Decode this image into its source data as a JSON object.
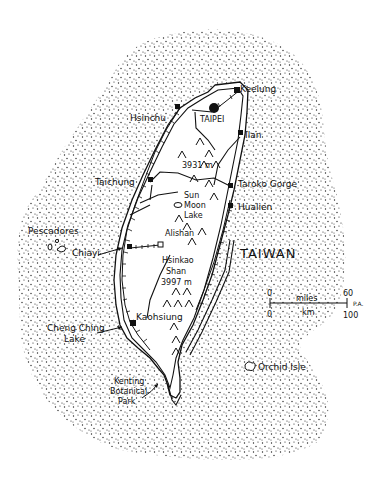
{
  "map": {
    "title": "TAIWAN",
    "cities": [
      {
        "name": "Keelung",
        "x": 240,
        "y": 92
      },
      {
        "name": "TAIPEI",
        "x": 205,
        "y": 117
      },
      {
        "name": "Hsinchu",
        "x": 130,
        "y": 118
      },
      {
        "name": "Ilan",
        "x": 242,
        "y": 135
      },
      {
        "name": "Taichung",
        "x": 95,
        "y": 185
      },
      {
        "name": "Taroko Gorge",
        "x": 238,
        "y": 184
      },
      {
        "name": "Hualien",
        "x": 238,
        "y": 208
      },
      {
        "name": "Chiayi",
        "x": 72,
        "y": 251
      },
      {
        "name": "Kaohsiung",
        "x": 135,
        "y": 322
      }
    ],
    "landmarks": [
      {
        "name": "Sun",
        "x": 182,
        "y": 191
      },
      {
        "name": "Moon",
        "x": 182,
        "y": 200
      },
      {
        "name": "Lake",
        "x": 182,
        "y": 209
      },
      {
        "name": "Alishan",
        "x": 165,
        "y": 231
      },
      {
        "name": "Hsinkao",
        "x": 162,
        "y": 262
      },
      {
        "name": "Shan",
        "x": 167,
        "y": 272
      },
      {
        "name": "3997 m",
        "x": 162,
        "y": 282
      },
      {
        "name": "3931 m",
        "x": 182,
        "y": 166
      },
      {
        "name": "Pescadores",
        "x": 28,
        "y": 232
      },
      {
        "name": "Cheng Ching",
        "x": 47,
        "y": 330
      },
      {
        "name": "Lake",
        "x": 65,
        "y": 340
      },
      {
        "name": "Kenting",
        "x": 115,
        "y": 381
      },
      {
        "name": "Botanical",
        "x": 110,
        "y": 391
      },
      {
        "name": "Park",
        "x": 118,
        "y": 401
      },
      {
        "name": "Orchid Isle",
        "x": 255,
        "y": 367
      }
    ],
    "scale": {
      "miles_label": "miles",
      "km_label": "km",
      "zero_top": "0",
      "zero_bottom": "0",
      "miles_max": "60",
      "km_max": "100",
      "signature": "P.A."
    },
    "colors": {
      "ink": "#111111",
      "paper": "#ffffff"
    }
  }
}
